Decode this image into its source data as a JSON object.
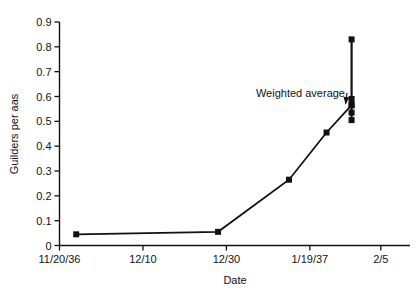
{
  "chart_data": {
    "type": "line",
    "title": "",
    "xlabel": "Date",
    "ylabel": "Guilders per aas",
    "ylim": [
      0,
      0.9
    ],
    "ytick_labels": [
      "0",
      "0.1",
      "0.2",
      "0.3",
      "0.4",
      "0.5",
      "0.6",
      "0.7",
      "0.8",
      "0.9"
    ],
    "ytick_values": [
      0,
      0.1,
      0.2,
      0.3,
      0.4,
      0.5,
      0.6,
      0.7,
      0.8,
      0.9
    ],
    "xtick_labels": [
      "11/20/36",
      "12/10",
      "12/30",
      "1/19/37",
      "2/5"
    ],
    "xtick_values": [
      0,
      20,
      40,
      60,
      77
    ],
    "xlim": [
      0,
      84
    ],
    "grid": false,
    "legend": false,
    "marker": "square",
    "line_color": "#111111",
    "marker_color": "#111111",
    "series": [
      {
        "name": "Weighted average",
        "x": [
          4,
          38,
          55,
          64,
          70
        ],
        "values": [
          0.045,
          0.055,
          0.265,
          0.455,
          0.565
        ]
      }
    ],
    "scatter_points": {
      "name": "Individual sale prices",
      "x": [
        70,
        70,
        70,
        70,
        70
      ],
      "values": [
        0.83,
        0.59,
        0.565,
        0.535,
        0.505
      ]
    },
    "vertical_range_bar": {
      "x": 70,
      "ymin": 0.505,
      "ymax": 0.83
    },
    "annotations": [
      {
        "text": "Weighted average",
        "points_to_x": 70,
        "points_to_y": 0.565
      }
    ]
  },
  "axis": {
    "ylabel": "Guilders per aas",
    "xlabel": "Date"
  }
}
